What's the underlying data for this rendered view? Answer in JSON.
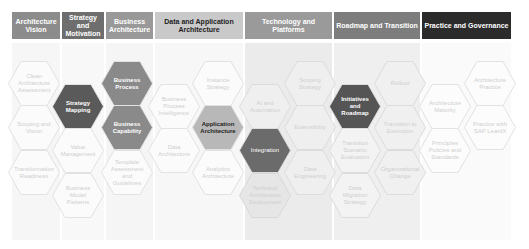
{
  "colors": {
    "header_vision": "#8c8c8c",
    "header_strategy": "#6e6e6e",
    "header_business": "#999999",
    "header_data_app": "#c9c9c9",
    "header_technology": "#9a9a9a",
    "header_roadmap": "#7d7d7d",
    "header_practice": "#2b2b2b",
    "hex_light_fill": "#fbfbfb",
    "hex_light_stroke": "#e2e2e2",
    "hex_dark_fill": "#5a5a5a",
    "hex_mid_fill": "#8a8a8a",
    "hex_accent_fill": "#b8b8b8"
  },
  "headers": [
    {
      "label": "Architecture Vision"
    },
    {
      "label": "Strategy and Motivation"
    },
    {
      "label": "Business Architecture"
    },
    {
      "label": "Data and Application Architecture"
    },
    {
      "label": "Technology and Platforms"
    },
    {
      "label": "Roadmap and Transition"
    },
    {
      "label": "Practice and Governance"
    }
  ],
  "hexagons": [
    {
      "label": "Clean Architecture Assessment"
    },
    {
      "label": "Scoping and Vision"
    },
    {
      "label": "Transformation Readiness"
    },
    {
      "label": "Strategy Mapping"
    },
    {
      "label": "Value Management"
    },
    {
      "label": "Business Model Patterns"
    },
    {
      "label": "Business Process"
    },
    {
      "label": "Business Capability"
    },
    {
      "label": "Template Assessment and Guidelines"
    },
    {
      "label": "Business Process Intelligence"
    },
    {
      "label": "Data Architecture"
    },
    {
      "label": "Instance Strategy"
    },
    {
      "label": "Application Architecture"
    },
    {
      "label": "Analytics Architecture"
    },
    {
      "label": "AI and Automation"
    },
    {
      "label": "Integration"
    },
    {
      "label": "Technical Architecture Deployment"
    },
    {
      "label": "Scoping Strategy"
    },
    {
      "label": "Extensibility"
    },
    {
      "label": "Data Engineering"
    },
    {
      "label": "Initiatives and Roadmap"
    },
    {
      "label": "Transition Scenario Evaluation"
    },
    {
      "label": "Data Migration Strategy"
    },
    {
      "label": "Rollout"
    },
    {
      "label": "Transition to Execution"
    },
    {
      "label": "Organizational Change"
    },
    {
      "label": "Architecture Maturity"
    },
    {
      "label": "Principles Policies and Standards"
    },
    {
      "label": "Architecture Practice"
    },
    {
      "label": "Practice with SAP LeanIX"
    }
  ]
}
